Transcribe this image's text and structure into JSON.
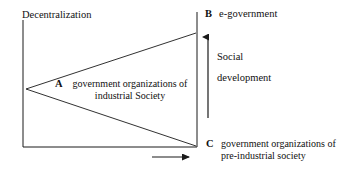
{
  "diagram": {
    "title_text": "Decentralization",
    "axes": {
      "y_axis_label": "Decentralization",
      "y_axis_name": "vertical-axis",
      "x_axis_name": "horizontal-axis",
      "right_axis_name": "right-vertical-axis"
    },
    "points": {
      "a": {
        "letter": "A",
        "text": "government organizations of industrial Society"
      },
      "b": {
        "letter": "B",
        "text": "e-government"
      },
      "c": {
        "letter": "C",
        "text": "government organizations of pre-industrial society"
      }
    },
    "annotations": {
      "social": "Social",
      "development": "development",
      "vertical_arrow_name": "social-development-arrow",
      "horizontal_arrow_name": "time-progression-arrow"
    },
    "colors": {
      "line": "#1a1a1a",
      "text": "#111111",
      "background": "#ffffff"
    }
  }
}
